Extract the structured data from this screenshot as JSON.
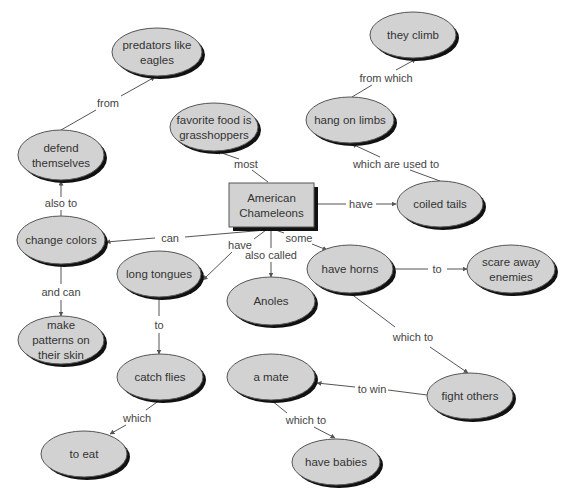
{
  "diagram": {
    "type": "concept-map",
    "colors": {
      "node_fill": "#d2d2d2",
      "node_stroke": "#555555",
      "shadow": "#111111",
      "line": "#555555",
      "text": "#333333",
      "background": "#ffffff"
    },
    "root": {
      "id": "american-chameleons",
      "lines": [
        "American",
        "Chameleons"
      ],
      "x": 229,
      "y": 183,
      "w": 85,
      "h": 44
    },
    "nodes": [
      {
        "id": "predators-like-eagles",
        "lines": [
          "predators like",
          "eagles"
        ],
        "cx": 157,
        "cy": 52,
        "rx": 45,
        "ry": 24
      },
      {
        "id": "they-climb",
        "lines": [
          "they climb"
        ],
        "cx": 413,
        "cy": 35,
        "rx": 43,
        "ry": 23
      },
      {
        "id": "favorite-food-is-grasshoppers",
        "lines": [
          "favorite food is",
          "grasshoppers"
        ],
        "cx": 214,
        "cy": 127,
        "rx": 44,
        "ry": 24
      },
      {
        "id": "hang-on-limbs",
        "lines": [
          "hang on limbs"
        ],
        "cx": 350,
        "cy": 120,
        "rx": 44,
        "ry": 23
      },
      {
        "id": "defend-themselves",
        "lines": [
          "defend",
          "themselves"
        ],
        "cx": 61,
        "cy": 155,
        "rx": 43,
        "ry": 25
      },
      {
        "id": "coiled-tails",
        "lines": [
          "coiled tails"
        ],
        "cx": 440,
        "cy": 204,
        "rx": 43,
        "ry": 23
      },
      {
        "id": "change-colors",
        "lines": [
          "change colors"
        ],
        "cx": 61,
        "cy": 240,
        "rx": 44,
        "ry": 24
      },
      {
        "id": "long-tongues",
        "lines": [
          "long tongues"
        ],
        "cx": 159,
        "cy": 274,
        "rx": 42,
        "ry": 23
      },
      {
        "id": "anoles",
        "lines": [
          "Anoles"
        ],
        "cx": 271,
        "cy": 301,
        "rx": 44,
        "ry": 24
      },
      {
        "id": "have-horns",
        "lines": [
          "have horns"
        ],
        "cx": 350,
        "cy": 269,
        "rx": 43,
        "ry": 24
      },
      {
        "id": "scare-away-enemies",
        "lines": [
          "scare away",
          "enemies"
        ],
        "cx": 511,
        "cy": 269,
        "rx": 44,
        "ry": 24
      },
      {
        "id": "make-patterns-on-their-skin",
        "lines": [
          "make",
          "patterns on",
          "their skin"
        ],
        "cx": 61,
        "cy": 340,
        "rx": 43,
        "ry": 24
      },
      {
        "id": "catch-flies",
        "lines": [
          "catch flies"
        ],
        "cx": 160,
        "cy": 377,
        "rx": 43,
        "ry": 23
      },
      {
        "id": "a-mate",
        "lines": [
          "a mate"
        ],
        "cx": 271,
        "cy": 377,
        "rx": 44,
        "ry": 23
      },
      {
        "id": "fight-others",
        "lines": [
          "fight others"
        ],
        "cx": 470,
        "cy": 396,
        "rx": 43,
        "ry": 23
      },
      {
        "id": "to-eat",
        "lines": [
          "to eat"
        ],
        "cx": 84,
        "cy": 454,
        "rx": 43,
        "ry": 23
      },
      {
        "id": "have-babies",
        "lines": [
          "have babies"
        ],
        "cx": 336,
        "cy": 462,
        "rx": 44,
        "ry": 23
      }
    ],
    "links": [
      {
        "label": "most",
        "from": "american-chameleons",
        "to": "favorite-food-is-grasshoppers",
        "lx": 246,
        "ly": 164,
        "p": [
          [
            268,
            182
          ],
          [
            252,
            170
          ]
        ],
        "q": [
          [
            239,
            159
          ],
          [
            216,
            151
          ]
        ]
      },
      {
        "label": "have",
        "from": "american-chameleons",
        "to": "coiled-tails",
        "lx": 361,
        "ly": 204,
        "p": [
          [
            314,
            204
          ],
          [
            346,
            204
          ]
        ],
        "q": [
          [
            376,
            204
          ],
          [
            396,
            204
          ]
        ]
      },
      {
        "label": "which are used to",
        "from": "coiled-tails",
        "to": "hang-on-limbs",
        "lx": 396,
        "ly": 164,
        "p": [
          [
            440,
            181
          ],
          [
            410,
            170
          ]
        ],
        "q": [
          [
            380,
            157
          ],
          [
            352,
            144
          ]
        ]
      },
      {
        "label": "from which",
        "from": "hang-on-limbs",
        "to": "they-climb",
        "lx": 386,
        "ly": 78,
        "p": [
          [
            352,
            97
          ],
          [
            372,
            85
          ]
        ],
        "q": [
          [
            396,
            70
          ],
          [
            416,
            59
          ]
        ]
      },
      {
        "label": "can",
        "from": "american-chameleons",
        "to": "change-colors",
        "lx": 170,
        "ly": 238,
        "p": [
          [
            266,
            230
          ],
          [
            185,
            237
          ]
        ],
        "q": [
          [
            155,
            238
          ],
          [
            106,
            242
          ]
        ]
      },
      {
        "label": "also to",
        "from": "change-colors",
        "to": "defend-themselves",
        "lx": 61,
        "ly": 203,
        "p": [
          [
            61,
            216
          ],
          [
            61,
            210
          ]
        ],
        "q": [
          [
            61,
            197
          ],
          [
            61,
            181
          ]
        ]
      },
      {
        "label": "from",
        "from": "defend-themselves",
        "to": "predators-like-eagles",
        "lx": 108,
        "ly": 103,
        "p": [
          [
            61,
            130
          ],
          [
            96,
            110
          ]
        ],
        "q": [
          [
            121,
            96
          ],
          [
            155,
            77
          ]
        ]
      },
      {
        "label": "have",
        "from": "american-chameleons",
        "to": "long-tongues",
        "lx": 240,
        "ly": 245,
        "p": [
          [
            266,
            230
          ],
          [
            254,
            239
          ]
        ],
        "q": [
          [
            232,
            252
          ],
          [
            203,
            280
          ]
        ]
      },
      {
        "label": "also called",
        "from": "american-chameleons",
        "to": "anoles",
        "lx": 271,
        "ly": 255,
        "p": [
          [
            271,
            230
          ],
          [
            271,
            248
          ]
        ],
        "q": [
          [
            271,
            262
          ],
          [
            271,
            277
          ]
        ]
      },
      {
        "label": "some",
        "from": "american-chameleons",
        "to": "have-horns",
        "lx": 299,
        "ly": 238,
        "p": [
          [
            273,
            229
          ],
          [
            284,
            233
          ]
        ],
        "q": [
          [
            312,
            244
          ],
          [
            327,
            250
          ]
        ]
      },
      {
        "label": "to",
        "from": "have-horns",
        "to": "scare-away-enemies",
        "lx": 437,
        "ly": 269,
        "p": [
          [
            393,
            269
          ],
          [
            428,
            269
          ]
        ],
        "q": [
          [
            447,
            269
          ],
          [
            467,
            269
          ]
        ]
      },
      {
        "label": "which to",
        "from": "have-horns",
        "to": "fight-others",
        "lx": 413,
        "ly": 337,
        "p": [
          [
            350,
            293
          ],
          [
            395,
            327
          ]
        ],
        "q": [
          [
            430,
            347
          ],
          [
            468,
            373
          ]
        ]
      },
      {
        "label": "to win",
        "from": "fight-others",
        "to": "a-mate",
        "lx": 372,
        "ly": 389,
        "p": [
          [
            427,
            395
          ],
          [
            388,
            390
          ]
        ],
        "q": [
          [
            355,
            387
          ],
          [
            317,
            383
          ]
        ]
      },
      {
        "label": "which to",
        "from": "a-mate",
        "to": "have-babies",
        "lx": 306,
        "ly": 420,
        "p": [
          [
            271,
            400
          ],
          [
            287,
            413
          ]
        ],
        "q": [
          [
            314,
            427
          ],
          [
            335,
            438
          ]
        ]
      },
      {
        "label": "and can",
        "from": "change-colors",
        "to": "make-patterns-on-their-skin",
        "lx": 61,
        "ly": 292,
        "p": [
          [
            61,
            264
          ],
          [
            61,
            284
          ]
        ],
        "q": [
          [
            61,
            300
          ],
          [
            61,
            316
          ]
        ]
      },
      {
        "label": "to",
        "from": "long-tongues",
        "to": "catch-flies",
        "lx": 159,
        "ly": 325,
        "p": [
          [
            159,
            297
          ],
          [
            159,
            316
          ]
        ],
        "q": [
          [
            159,
            333
          ],
          [
            159,
            354
          ]
        ]
      },
      {
        "label": "which",
        "from": "catch-flies",
        "to": "to-eat",
        "lx": 137,
        "ly": 418,
        "p": [
          [
            160,
            400
          ],
          [
            146,
            410
          ]
        ],
        "q": [
          [
            126,
            425
          ],
          [
            110,
            434
          ]
        ]
      }
    ]
  }
}
